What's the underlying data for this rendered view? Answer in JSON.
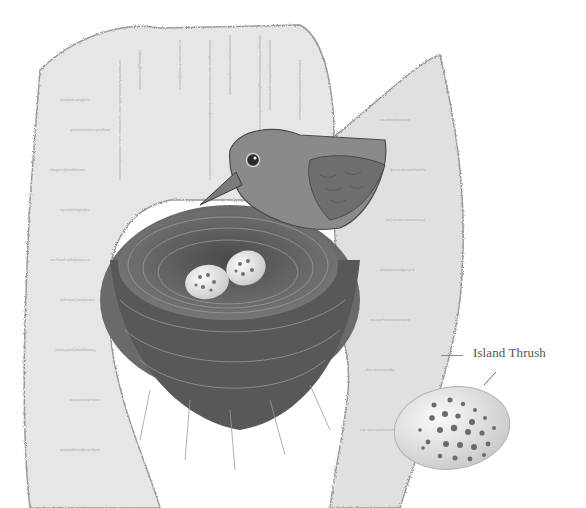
{
  "illustration": {
    "subject": "bird on nest in tree hollow with two eggs",
    "style": "pencil drawing, grayscale",
    "colors": {
      "background": "#ffffff",
      "ink": "#3a3a3a",
      "bark": "#cfcfcf",
      "nest": "#5a5a5a",
      "egg": "#ececec",
      "spots": "#6a6a6a"
    }
  },
  "annotation": {
    "label": "Island Thrush"
  }
}
